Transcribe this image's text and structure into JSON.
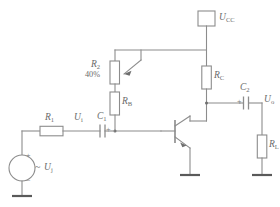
{
  "diagram": {
    "type": "schematic",
    "colors": {
      "wire": "#8c8c8c",
      "label": "#6b6b6b",
      "ground": "#5a5a5a",
      "background": "#ffffff"
    }
  },
  "labels": {
    "supply": "U",
    "supply_sub": "CC",
    "pot": "R",
    "pot_sub": "2",
    "pot_value": "40%",
    "base_resistor": "R",
    "base_resistor_sub": "B",
    "collector_resistor": "R",
    "collector_resistor_sub": "C",
    "input_resistor": "R",
    "input_resistor_sub": "1",
    "input_voltage": "U",
    "input_voltage_sub": "i",
    "input_cap": "C",
    "input_cap_sub": "1",
    "output_cap": "C",
    "output_cap_sub": "2",
    "output_voltage": "U",
    "output_voltage_sub": "o",
    "load_resistor": "R",
    "load_resistor_sub": "L",
    "source_voltage": "U",
    "source_voltage_sub": "j"
  },
  "signs": {
    "source_plus": "+",
    "source_minus": "_",
    "cap1_plus": "+",
    "cap2_plus": "+",
    "ac_symbol": "~"
  },
  "components": [
    {
      "id": "vcc-terminal",
      "kind": "terminal",
      "label": "U_CC"
    },
    {
      "id": "potentiometer-r2",
      "kind": "potentiometer",
      "label": "R_2",
      "value": "40%"
    },
    {
      "id": "resistor-rb",
      "kind": "resistor",
      "label": "R_B"
    },
    {
      "id": "resistor-rc",
      "kind": "resistor",
      "label": "R_C"
    },
    {
      "id": "resistor-r1",
      "kind": "resistor",
      "label": "R_1"
    },
    {
      "id": "resistor-rl",
      "kind": "resistor",
      "label": "R_L"
    },
    {
      "id": "capacitor-c1",
      "kind": "capacitor-polarized",
      "label": "C_1"
    },
    {
      "id": "capacitor-c2",
      "kind": "capacitor-polarized",
      "label": "C_2"
    },
    {
      "id": "transistor-npn",
      "kind": "transistor-npn",
      "label": ""
    },
    {
      "id": "ac-source",
      "kind": "voltage-source-ac",
      "label": "U_j"
    },
    {
      "id": "ground-emitter",
      "kind": "ground",
      "label": ""
    },
    {
      "id": "ground-load",
      "kind": "ground",
      "label": ""
    },
    {
      "id": "ground-source",
      "kind": "ground",
      "label": ""
    }
  ]
}
